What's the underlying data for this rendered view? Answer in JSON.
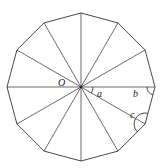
{
  "diagram": {
    "type": "regular-polygon",
    "sides": 12,
    "labels": {
      "center": "O",
      "central_angle": "a",
      "base_angle": "b",
      "interior_angle": "c"
    },
    "stroke_color": "#333333"
  }
}
